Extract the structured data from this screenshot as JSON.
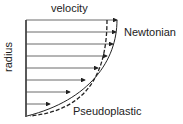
{
  "diagram": {
    "title": "velocity",
    "y_axis_label": "radius",
    "curves": [
      {
        "name": "Newtonian",
        "style": "solid"
      },
      {
        "name": "Pseudoplastic",
        "style": "dashed"
      }
    ],
    "arrow_count": 8,
    "line_color": "#222222"
  }
}
